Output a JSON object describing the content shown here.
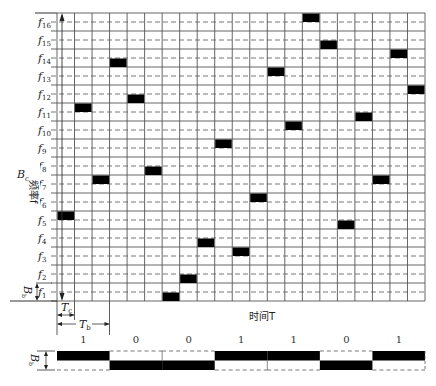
{
  "diagram": {
    "title": "",
    "frequency_axis_label": "频率f",
    "time_axis_label": "时间T",
    "total_bandwidth_label": "B_c",
    "bit_bandwidth_label": "B_b",
    "chip_time_label": "T_c",
    "bit_time_label": "T_b",
    "frequency_labels": [
      "f1",
      "f2",
      "f3",
      "f4",
      "f5",
      "f6",
      "f7",
      "f8",
      "f9",
      "f10",
      "f11",
      "f12",
      "f13",
      "f14",
      "f15",
      "f16"
    ],
    "num_frequencies": 16,
    "num_chips": 21,
    "chips_per_bit": 3,
    "hops": [
      {
        "chip": 0,
        "freq": 5,
        "half": "upper"
      },
      {
        "chip": 1,
        "freq": 11,
        "half": "upper"
      },
      {
        "chip": 2,
        "freq": 7,
        "half": "upper"
      },
      {
        "chip": 3,
        "freq": 14,
        "half": "lower"
      },
      {
        "chip": 4,
        "freq": 12,
        "half": "lower"
      },
      {
        "chip": 5,
        "freq": 8,
        "half": "lower"
      },
      {
        "chip": 6,
        "freq": 1,
        "half": "lower"
      },
      {
        "chip": 7,
        "freq": 2,
        "half": "lower"
      },
      {
        "chip": 8,
        "freq": 4,
        "half": "lower"
      },
      {
        "chip": 9,
        "freq": 9,
        "half": "upper"
      },
      {
        "chip": 10,
        "freq": 3,
        "half": "upper"
      },
      {
        "chip": 11,
        "freq": 6,
        "half": "upper"
      },
      {
        "chip": 12,
        "freq": 13,
        "half": "upper"
      },
      {
        "chip": 13,
        "freq": 10,
        "half": "upper"
      },
      {
        "chip": 14,
        "freq": 16,
        "half": "upper"
      },
      {
        "chip": 15,
        "freq": 15,
        "half": "lower"
      },
      {
        "chip": 16,
        "freq": 5,
        "half": "lower"
      },
      {
        "chip": 17,
        "freq": 11,
        "half": "lower"
      },
      {
        "chip": 18,
        "freq": 7,
        "half": "upper"
      },
      {
        "chip": 19,
        "freq": 14,
        "half": "upper"
      },
      {
        "chip": 20,
        "freq": 12,
        "half": "upper"
      }
    ],
    "bit_stream": {
      "bits": [
        "1",
        "0",
        "0",
        "1",
        "1",
        "0",
        "1"
      ]
    },
    "colors": {
      "grid_solid": "#555555",
      "grid_dashed": "#555555",
      "block": "#000000",
      "background": "#ffffff"
    }
  }
}
